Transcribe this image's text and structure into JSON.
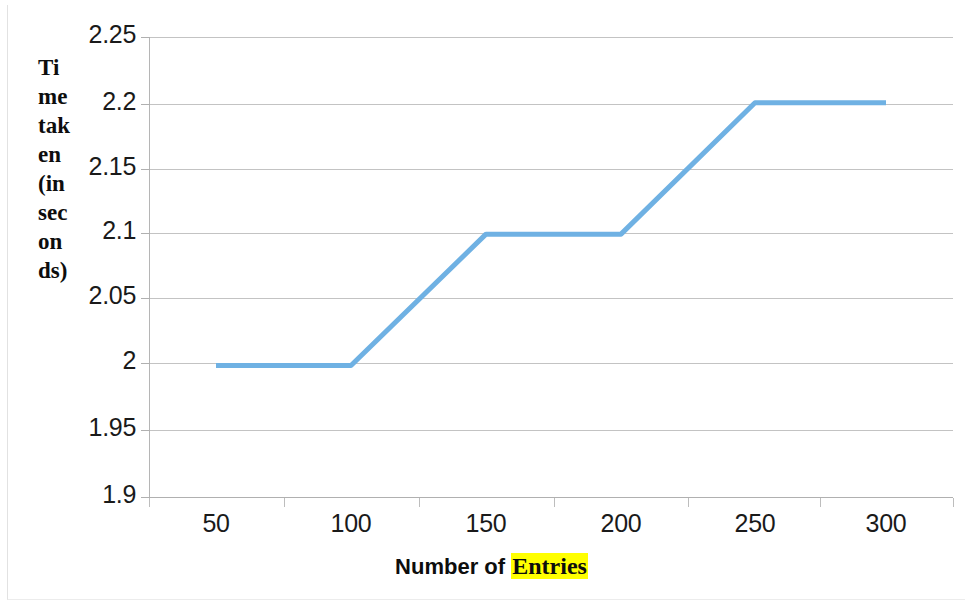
{
  "chart_data": {
    "type": "line",
    "title": "",
    "xlabel": "Number of Entries",
    "xlabel_parts": [
      {
        "text": "Number of ",
        "highlight": false
      },
      {
        "text": "Entries",
        "highlight": true
      }
    ],
    "ylabel": "Time taken (in seconds)",
    "categories": [
      "50",
      "100",
      "150",
      "200",
      "250",
      "300"
    ],
    "x": [
      50,
      100,
      150,
      200,
      250,
      300
    ],
    "values": [
      2.0,
      2.0,
      2.1,
      2.1,
      2.2,
      2.2
    ],
    "series": [
      {
        "name": "Time taken (in seconds)",
        "values": [
          2.0,
          2.0,
          2.1,
          2.1,
          2.2,
          2.2
        ]
      }
    ],
    "ylim": [
      1.9,
      2.25
    ],
    "y_ticks": [
      2.25,
      2.2,
      2.15,
      2.1,
      2.05,
      2,
      1.95,
      1.9
    ],
    "y_tick_labels": [
      "2.25",
      "2.2",
      "2.15",
      "2.1",
      "2.05",
      "2",
      "1.95",
      "1.9"
    ],
    "x_tick_labels": [
      "50",
      "100",
      "150",
      "200",
      "250",
      "300"
    ],
    "grid": "horizontal",
    "legend": "none",
    "markers": "none"
  },
  "axes": {
    "y_title_wrapped": "Time taken (in seconds)",
    "y_title_lines": [
      "Ti",
      "me",
      "tak",
      "en",
      "(in",
      "sec",
      "on",
      "ds)"
    ]
  },
  "colors": {
    "series_line": "#6FB1E3",
    "gridline": "#b8b8b8",
    "axis_line": "#b0b0b0",
    "tick_label": "#1a1a1a",
    "title_text": "#0d0d0d",
    "highlight_background": "#ffff00",
    "plot_background": "#ffffff"
  },
  "y_tick_positions_px": [
    32,
    99,
    164,
    228,
    293,
    358,
    425,
    492
  ],
  "x_tick_positions_px": [
    141,
    276,
    411,
    546,
    680,
    812,
    945
  ],
  "x_label_centers_px": [
    208,
    343,
    478,
    613,
    747,
    878
  ]
}
